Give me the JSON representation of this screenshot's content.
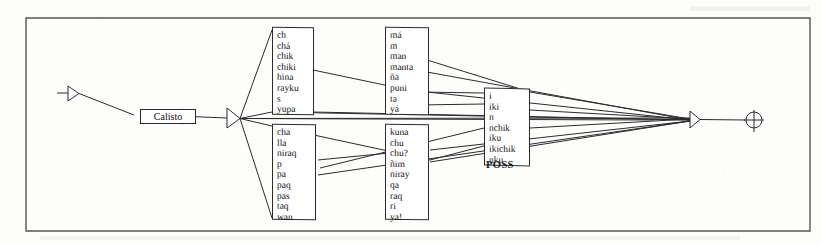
{
  "figure": {
    "title": "",
    "frame": {
      "visible": true
    },
    "start_marker": {
      "name": "input-arrow-marker"
    },
    "source_node": {
      "label": "Calisto"
    },
    "split_node": {
      "name": "fan-split-node"
    },
    "merge_node": {
      "name": "fan-merge-node"
    },
    "end_marker": {
      "name": "output-arrow-marker"
    },
    "terminator": {
      "name": "circle-cross-terminator"
    }
  },
  "boxes": [
    {
      "id": "box-suffix-upper-left",
      "items": [
        "ch",
        "chá",
        "chik",
        "chiki",
        "hina",
        "rayku",
        "s",
        "yupa"
      ]
    },
    {
      "id": "box-suffix-upper-mid",
      "items": [
        "má",
        "m",
        "man",
        "manta",
        "ña",
        "puni",
        "ta",
        "yá"
      ]
    },
    {
      "id": "box-suffix-poss",
      "items": [
        "i",
        "iki",
        "n",
        "nchik",
        "iku",
        "ikichik",
        "nku"
      ],
      "caption": "POSS"
    },
    {
      "id": "box-suffix-lower-left",
      "items": [
        "cha",
        "lla",
        "niraq",
        "p",
        "pa",
        "paq",
        "pas",
        "taq",
        "wan"
      ]
    },
    {
      "id": "box-suffix-lower-mid",
      "items": [
        "kuna",
        "chu",
        "chu?",
        "ñim",
        "niray",
        "qa",
        "raq",
        "ri",
        "ya!"
      ]
    }
  ],
  "colors": {
    "ink": "#2b2b2b",
    "paper": "#fdfdfb",
    "box_fill": "#ffffff"
  }
}
